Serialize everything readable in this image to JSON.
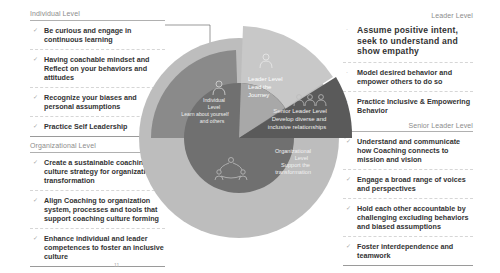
{
  "slide": {
    "page_number": "11"
  },
  "individual_level": {
    "title": "Individual Level",
    "items": [
      "Be curious and engage in continuous learning",
      "Having coachable mindset and Reflect on your behaviors and attitudes",
      "Recognize your biases and personal assumptions",
      "Practice Self Leadership"
    ]
  },
  "organizational_level": {
    "title": "Organizational Level",
    "items": [
      "Create a sustainable coaching culture strategy for organizational transformation",
      "Align Coaching to organization system, processes and tools that support coaching culture forming",
      "Enhance individual and leader competences to foster an inclusive culture"
    ]
  },
  "leader_level": {
    "title": "Leader Level",
    "items": [
      "Assume positive intent, seek to understand and show empathy",
      "Model desired behavior and empower others to do so",
      "Practice Inclusive & Empowering Behavior"
    ]
  },
  "senior_leader_level": {
    "title": "Senior Leader Level",
    "items": [
      "Understand and communicate how Coaching connects to mission and vision",
      "Engage a broad range of voices and perspectives",
      "Hold each other accountable by challenging excluding behaviors and biased assumptions",
      "Foster interdependence and teamwork"
    ]
  },
  "wheel": {
    "individual": {
      "line1": "Individual",
      "line2": "Level",
      "line3": "Learn about yourself",
      "line4": "and others"
    },
    "leader": {
      "line1": "Leader Level",
      "line2": "Lead the",
      "line3": "Journey"
    },
    "senior": {
      "line1": "Senior Leader Level",
      "line2": "Develop diverse and",
      "line3": "inclusive relationships"
    },
    "organizational": {
      "line1": "Organizational",
      "line2": "Level",
      "line3": "Support the",
      "line4": "transformation"
    },
    "colors": {
      "individual": "#8a8a8a",
      "leader": "#c4c4c4",
      "senior": "#5c5c5c",
      "organizational": "#b9b9b9",
      "center": "#6e6e6e"
    }
  }
}
